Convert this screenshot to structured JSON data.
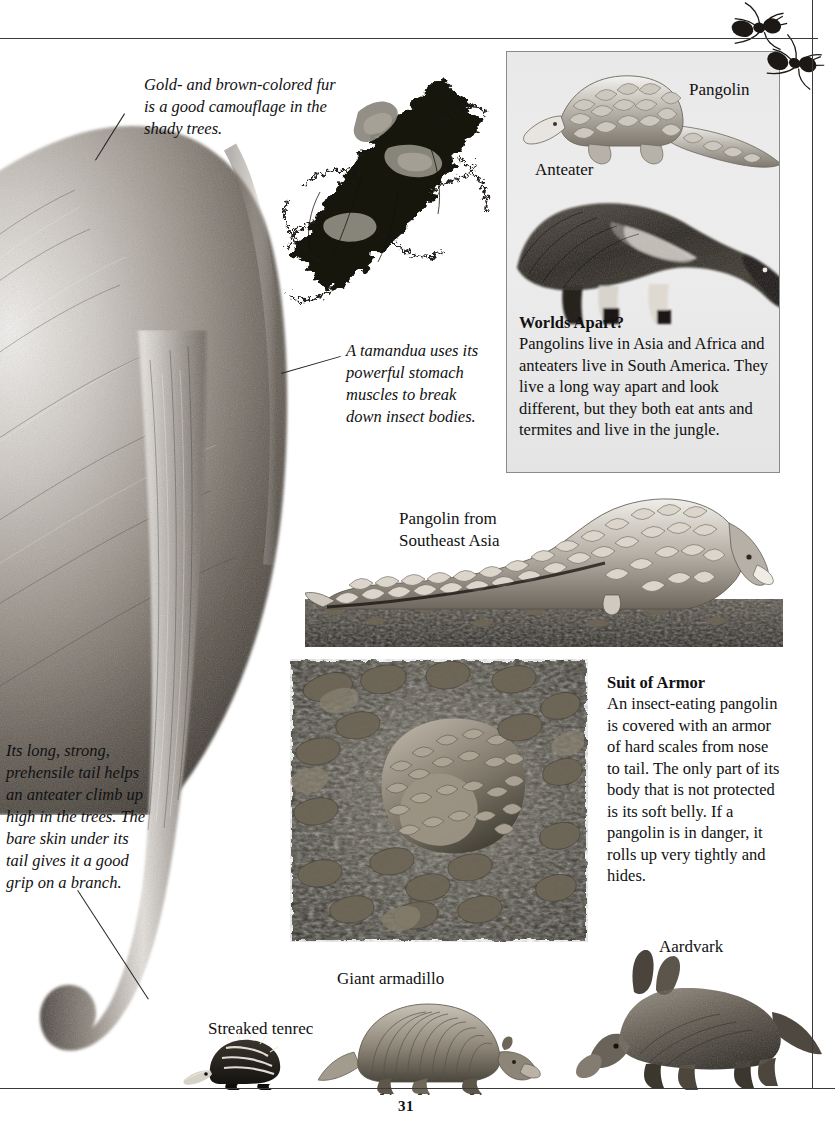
{
  "page": {
    "number": "31",
    "background_color": "#ffffff",
    "rule_color": "#3a3a3a"
  },
  "captions": {
    "fur_camouflage": "Gold- and brown-colored fur is a good camouflage in the shady trees.",
    "tamandua_stomach": "A tamandua uses its powerful stomach muscles to break down insect bodies.",
    "prehensile_tail": "Its long, strong, prehensile tail helps an anteater climb up high in the trees. The bare skin under its tail gives it a good grip on a branch."
  },
  "labels": {
    "pangolin": "Pangolin",
    "anteater": "Anteater",
    "pangolin_southeast_asia": "Pangolin from Southeast Asia",
    "streaked_tenrec": "Streaked tenrec",
    "giant_armadillo": "Giant armadillo",
    "aardvark": "Aardvark"
  },
  "info_box": {
    "heading": "Worlds Apart?",
    "body": "Pangolins live in Asia and Africa and anteaters live in South America. They live a long way apart and look different, but they both eat ants and termites and live in the jungle.",
    "border_color": "#8b8b8b",
    "fill_color": "#ebebeb"
  },
  "suit_of_armor": {
    "heading": "Suit of Armor",
    "body": "An insect-eating pangolin is covered with an armor of hard scales from nose to tail. The only part of its body that is not protected is its soft belly. If a pangolin is in danger, it rolls up very tightly and hides."
  },
  "figures": {
    "anteater_body": "anteater-fur-body-photo",
    "epiphyte_branch": "dark-epiphyte-branch-photo",
    "pangolin_illustration": "pangolin-line-illustration",
    "anteater_illustration": "giant-anteater-photo",
    "pangolin_photo": "pangolin-walking-photo",
    "rolled_pangolin_photo": "rolled-pangolin-in-leaves-photo",
    "tenrec_illustration": "streaked-tenrec-illustration",
    "armadillo_illustration": "giant-armadillo-illustration",
    "aardvark_illustration": "aardvark-illustration",
    "ants": "ant-illustrations"
  }
}
